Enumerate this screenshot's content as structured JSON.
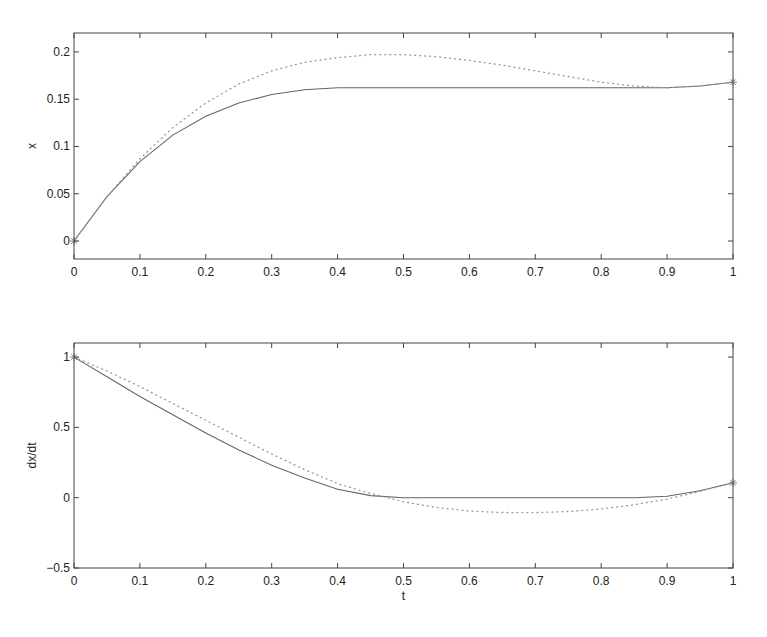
{
  "figure": {
    "width": 767,
    "height": 637,
    "background": "#ffffff"
  },
  "colors": {
    "axes": "#444444",
    "solid": "#666666",
    "dotted": "#999999",
    "marker": "#888888",
    "text": "#222222"
  },
  "chart_data": [
    {
      "type": "line",
      "title": "",
      "xlabel": "",
      "ylabel": "x",
      "xlim": [
        0,
        1
      ],
      "ylim": [
        -0.019,
        0.22
      ],
      "grid": false,
      "legend": null,
      "xticks": [
        0,
        0.1,
        0.2,
        0.3,
        0.4,
        0.5,
        0.6,
        0.7,
        0.8,
        0.9,
        1
      ],
      "xtick_labels": [
        "0",
        "0.1",
        "0.2",
        "0.3",
        "0.4",
        "0.5",
        "0.6",
        "0.7",
        "0.8",
        "0.9",
        "1"
      ],
      "yticks": [
        0,
        0.05,
        0.1,
        0.15,
        0.2
      ],
      "ytick_labels": [
        "0",
        "0.05",
        "0.1",
        "0.15",
        "0.2"
      ],
      "x": [
        0,
        0.05,
        0.1,
        0.15,
        0.2,
        0.25,
        0.3,
        0.35,
        0.4,
        0.45,
        0.5,
        0.55,
        0.6,
        0.65,
        0.7,
        0.75,
        0.8,
        0.85,
        0.9,
        0.95,
        1
      ],
      "series": [
        {
          "name": "solid",
          "style": "solid",
          "values": [
            0,
            0.047,
            0.084,
            0.112,
            0.132,
            0.146,
            0.155,
            0.16,
            0.162,
            0.162,
            0.162,
            0.162,
            0.162,
            0.162,
            0.162,
            0.162,
            0.162,
            0.162,
            0.162,
            0.164,
            0.168
          ]
        },
        {
          "name": "dotted",
          "style": "dotted",
          "values": [
            0,
            0.047,
            0.087,
            0.12,
            0.146,
            0.166,
            0.18,
            0.189,
            0.194,
            0.197,
            0.197,
            0.195,
            0.191,
            0.186,
            0.18,
            0.174,
            0.168,
            0.164,
            0.162,
            0.164,
            0.168
          ]
        }
      ],
      "markers": [
        {
          "x": 0,
          "y": 0,
          "symbol": "*"
        },
        {
          "x": 1,
          "y": 0.168,
          "symbol": "*"
        }
      ]
    },
    {
      "type": "line",
      "title": "",
      "xlabel": "t",
      "ylabel": "dx/dt",
      "xlim": [
        0,
        1
      ],
      "ylim": [
        -0.5,
        1.1
      ],
      "grid": false,
      "legend": null,
      "xticks": [
        0,
        0.1,
        0.2,
        0.3,
        0.4,
        0.5,
        0.6,
        0.7,
        0.8,
        0.9,
        1
      ],
      "xtick_labels": [
        "0",
        "0.1",
        "0.2",
        "0.3",
        "0.4",
        "0.5",
        "0.6",
        "0.7",
        "0.8",
        "0.9",
        "1"
      ],
      "yticks": [
        -0.5,
        0,
        0.5,
        1
      ],
      "ytick_labels": [
        "-0.5",
        "0",
        "0.5",
        "1"
      ],
      "x": [
        0,
        0.05,
        0.1,
        0.15,
        0.2,
        0.25,
        0.3,
        0.35,
        0.4,
        0.45,
        0.5,
        0.55,
        0.6,
        0.65,
        0.7,
        0.75,
        0.8,
        0.85,
        0.9,
        0.95,
        1
      ],
      "series": [
        {
          "name": "solid",
          "style": "solid",
          "values": [
            1,
            0.86,
            0.72,
            0.59,
            0.46,
            0.34,
            0.23,
            0.14,
            0.06,
            0.015,
            0,
            0,
            0,
            0,
            0,
            0,
            0,
            0,
            0.01,
            0.05,
            0.106
          ]
        },
        {
          "name": "dotted",
          "style": "dotted",
          "values": [
            1,
            0.9,
            0.79,
            0.67,
            0.55,
            0.43,
            0.31,
            0.2,
            0.1,
            0.03,
            -0.03,
            -0.07,
            -0.095,
            -0.105,
            -0.106,
            -0.098,
            -0.08,
            -0.05,
            -0.01,
            0.045,
            0.106
          ]
        }
      ],
      "markers": [
        {
          "x": 0,
          "y": 1,
          "symbol": "*"
        },
        {
          "x": 1,
          "y": 0.106,
          "symbol": "*"
        }
      ]
    }
  ],
  "layout": {
    "panels": [
      {
        "left": 74,
        "right": 733,
        "top": 33,
        "bottom": 259
      },
      {
        "left": 74,
        "right": 733,
        "top": 343,
        "bottom": 568
      }
    ]
  }
}
